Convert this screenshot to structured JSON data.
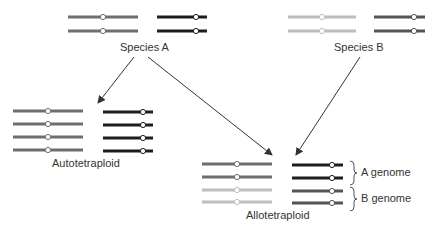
{
  "labels": {
    "species_a": "Species A",
    "species_b": "Species B",
    "autotetraploid": "Autotetraploid",
    "allotetraploid": "Allotetraploid",
    "a_genome": "A genome",
    "b_genome": "B genome"
  },
  "colors": {
    "gray_chromosome": "#6e6e6e",
    "black_chromosome": "#1e1e1e",
    "light_chromosome": "#bdbdbd",
    "mid_chromosome": "#555555",
    "arrow": "#333333"
  }
}
